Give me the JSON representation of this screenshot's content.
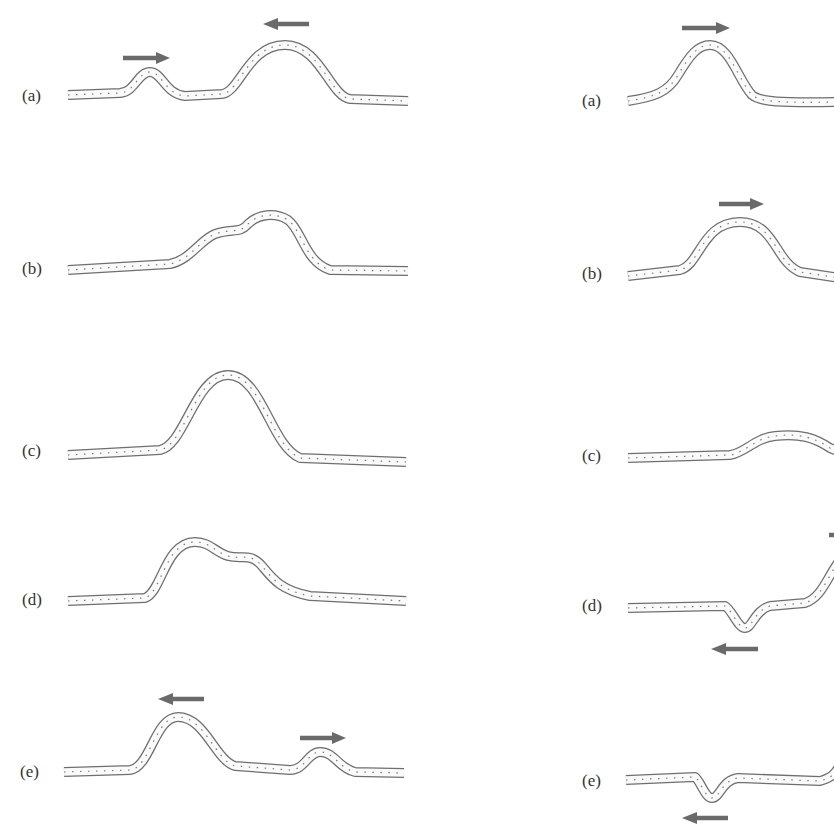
{
  "figure": {
    "left_column": {
      "name": "upright-pulses-superposition",
      "panels": [
        {
          "label": "(a)",
          "description": "Small pulse moving right, large pulse moving left",
          "arrows": [
            "right",
            "left"
          ]
        },
        {
          "label": "(b)",
          "description": "Pulses begin to overlap",
          "arrows": []
        },
        {
          "label": "(c)",
          "description": "Pulses fully overlap, combined amplitude",
          "arrows": []
        },
        {
          "label": "(d)",
          "description": "Pulses separating",
          "arrows": []
        },
        {
          "label": "(e)",
          "description": "Large pulse moving left, small pulse moving right",
          "arrows": [
            "left",
            "right"
          ]
        }
      ]
    },
    "right_column": {
      "name": "inverted-pulse-superposition",
      "panels": [
        {
          "label": "(a)",
          "description": "Upright pulse moving right",
          "arrows": [
            "right"
          ]
        },
        {
          "label": "(b)",
          "description": "Upright pulse moving right",
          "arrows": [
            "right"
          ]
        },
        {
          "label": "(c)",
          "description": "Pulses partially cancel",
          "arrows": []
        },
        {
          "label": "(d)",
          "description": "Inverted pulse moving left, upright pulse moving right",
          "arrows": [
            "left",
            "right"
          ]
        },
        {
          "label": "(e)",
          "description": "Inverted pulse moving left",
          "arrows": [
            "left"
          ]
        }
      ]
    },
    "colors": {
      "rope_outline": "#6e6e6e",
      "rope_fill": "#fafafa",
      "arrow": "#6a6a6a",
      "label": "#333333"
    }
  }
}
